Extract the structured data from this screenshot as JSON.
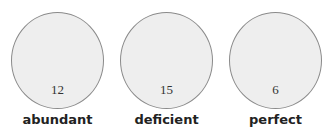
{
  "sets": [
    {
      "label": "abundant",
      "count": "12"
    },
    {
      "label": "deficient",
      "count": "15"
    },
    {
      "label": "perfect",
      "count": "6"
    }
  ],
  "colors": {
    "fill": "#eeeeee",
    "stroke": "#8a8a8a",
    "text": "#222222"
  }
}
